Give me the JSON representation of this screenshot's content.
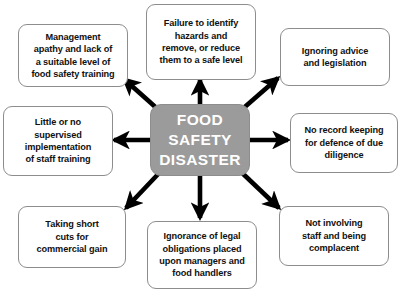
{
  "diagram": {
    "background_color": "#ffffff",
    "center": {
      "label": "FOOD\nSAFETY\nDISASTER",
      "fill_color": "#9b9b9b",
      "text_color": "#ffffff"
    },
    "arrow_color": "#000000",
    "node_fill_color": "#ffffff",
    "node_border_color": "#8d8d8d",
    "node_text_color": "#111111",
    "nodes": [
      {
        "id": "top-left",
        "label": "Management\napathy and lack of\na suitable level of\nfood safety training",
        "direction": "up-left"
      },
      {
        "id": "top-center",
        "label": "Failure to identify\nhazards and\nremove, or reduce\nthem to a safe level",
        "direction": "up"
      },
      {
        "id": "top-right",
        "label": "Ignoring advice\nand legislation",
        "direction": "up-right"
      },
      {
        "id": "mid-left",
        "label": "Little or no\nsupervised\nimplementation\nof staff training",
        "direction": "left"
      },
      {
        "id": "mid-right",
        "label": "No record keeping\nfor defence of due\ndiligence",
        "direction": "right"
      },
      {
        "id": "bottom-left",
        "label": "Taking short\ncuts for\ncommercial gain",
        "direction": "down-left"
      },
      {
        "id": "bottom-center",
        "label": "Ignorance of legal\nobligations placed\nupon managers and\nfood handlers",
        "direction": "down"
      },
      {
        "id": "bottom-right",
        "label": "Not involving\nstaff and being\ncomplacent",
        "direction": "down-right"
      }
    ]
  }
}
